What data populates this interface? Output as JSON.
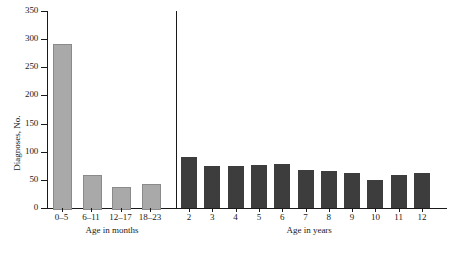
{
  "chart_data": {
    "type": "bar",
    "title": "",
    "xlabel": "",
    "ylabel": "Diagnoses, No.",
    "ylim": [
      0,
      350
    ],
    "yticks": [
      0,
      50,
      100,
      150,
      200,
      250,
      300,
      350
    ],
    "ytick_labels": [
      "0",
      "50",
      "100",
      "150",
      "200",
      "250",
      "300",
      "350"
    ],
    "grid": false,
    "legend": "none",
    "groups": [
      {
        "name": "Age in months",
        "label": "Age in months",
        "color": "#a9a9a9",
        "categories": [
          "0–5",
          "6–11",
          "12–17",
          "18–23"
        ],
        "values": [
          291,
          59,
          37,
          42
        ]
      },
      {
        "name": "Age in years",
        "label": "Age in years",
        "color": "#3d3d3d",
        "categories": [
          "2",
          "3",
          "4",
          "5",
          "6",
          "7",
          "8",
          "9",
          "10",
          "11",
          "12"
        ],
        "values": [
          91,
          75,
          75,
          77,
          78,
          68,
          65,
          63,
          49,
          58,
          62
        ]
      }
    ],
    "categories": [
      "0–5",
      "6–11",
      "12–17",
      "18–23",
      "2",
      "3",
      "4",
      "5",
      "6",
      "7",
      "8",
      "9",
      "10",
      "11",
      "12"
    ],
    "values": [
      291,
      59,
      37,
      42,
      91,
      75,
      75,
      77,
      78,
      68,
      65,
      63,
      49,
      58,
      62
    ]
  },
  "axes": {
    "y_title": "Diagnoses, No.",
    "group_label_months": "Age in months",
    "group_label_years": "Age in years"
  }
}
